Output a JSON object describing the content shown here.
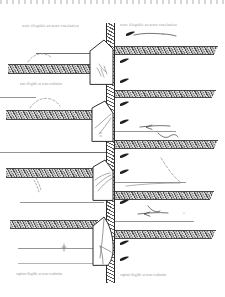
{
  "drawing": {
    "media": "scanned engineering cross-section",
    "page_width": 225,
    "page_height": 297,
    "background_color": "#ffffff",
    "ink_color": "#3a3a3a",
    "hatch_color": "#4a4a4a",
    "band_fill_color": "#b9b9b9"
  },
  "annotations": {
    "top_left_note": "note illegible at scan resolution",
    "top_right_note": "note illegible at scan resolution",
    "left_mid_note": "note illegible at scan resolution",
    "left_lower_note": "note illegible at scan resolution",
    "bottom_left_caption": "caption illegible at scan resolution",
    "bottom_right_caption": "caption illegible at scan resolution"
  },
  "strata": {
    "left": [
      {
        "id": "left-band-1",
        "x": 8,
        "y": 64,
        "width": 92,
        "height": 8
      },
      {
        "id": "left-band-2",
        "x": 6,
        "y": 110,
        "width": 96,
        "height": 8
      },
      {
        "id": "left-band-3",
        "x": 6,
        "y": 168,
        "width": 96,
        "height": 8
      },
      {
        "id": "left-band-4",
        "x": 10,
        "y": 220,
        "width": 90,
        "height": 7
      }
    ],
    "right": [
      {
        "id": "right-band-1",
        "x": 114,
        "y": 46,
        "width": 106,
        "height": 7
      },
      {
        "id": "right-band-2",
        "x": 114,
        "y": 90,
        "width": 104,
        "height": 6
      },
      {
        "id": "right-band-3",
        "x": 114,
        "y": 140,
        "width": 106,
        "height": 7
      },
      {
        "id": "right-band-4",
        "x": 114,
        "y": 191,
        "width": 102,
        "height": 7
      },
      {
        "id": "right-band-5",
        "x": 114,
        "y": 230,
        "width": 104,
        "height": 7
      }
    ]
  },
  "column": {
    "label": "central vertical wall section",
    "x": 106,
    "y": 23,
    "width": 7,
    "height": 260
  },
  "blocks": [
    {
      "id": "block-1",
      "label": "wedge block 1",
      "x": 88,
      "y": 44,
      "width": 28,
      "height": 40
    },
    {
      "id": "block-2",
      "label": "wedge block 2",
      "x": 90,
      "y": 100,
      "width": 26,
      "height": 42
    },
    {
      "id": "block-3",
      "label": "wedge block 3",
      "x": 92,
      "y": 160,
      "width": 24,
      "height": 42
    },
    {
      "id": "block-4",
      "label": "wedge block 4",
      "x": 92,
      "y": 216,
      "width": 25,
      "height": 50
    }
  ],
  "markers": {
    "label": "flow direction darts",
    "count": 9,
    "direction": "left",
    "color": "#1f1f1f"
  },
  "rules": {
    "label": "reference and ground-surface lines",
    "count": 10
  }
}
